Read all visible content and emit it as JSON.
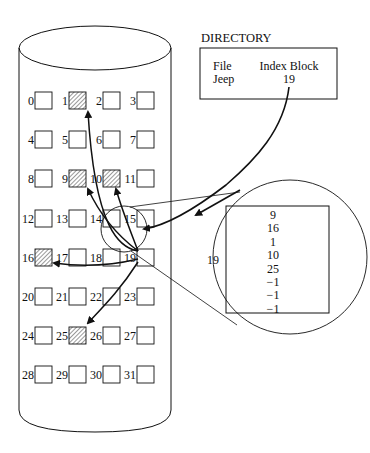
{
  "directory": {
    "title": "DIRECTORY",
    "headers": [
      "File",
      "Index Block"
    ],
    "rows": [
      {
        "file": "Jeep",
        "index_block": "19"
      }
    ]
  },
  "disk": {
    "blocks": [
      "0",
      "1",
      "2",
      "3",
      "4",
      "5",
      "6",
      "7",
      "8",
      "9",
      "10",
      "11",
      "12",
      "13",
      "14",
      "15",
      "16",
      "17",
      "18",
      "19",
      "20",
      "21",
      "22",
      "23",
      "24",
      "25",
      "26",
      "27",
      "28",
      "29",
      "30",
      "31"
    ],
    "allocated_blocks": [
      1,
      9,
      10,
      16,
      25
    ],
    "index_block": 19
  },
  "index_block_detail": {
    "label": "19",
    "entries": [
      "9",
      "16",
      "1",
      "10",
      "25",
      "−1",
      "−1",
      "−1"
    ]
  },
  "colors": {
    "line": "#111111",
    "hatch": "#555555",
    "background": "#ffffff"
  }
}
